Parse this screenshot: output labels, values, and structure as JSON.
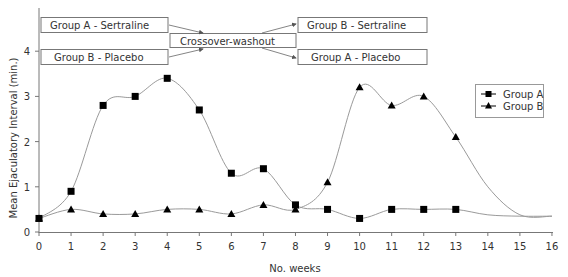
{
  "chart_data": {
    "type": "line",
    "title": "",
    "xlabel": "No. weeks",
    "ylabel": "Mean Ejaculatory Interval (min.)",
    "xlim": [
      0,
      16
    ],
    "ylim": [
      0,
      4.4
    ],
    "x_ticks": [
      0,
      1,
      2,
      3,
      4,
      5,
      6,
      7,
      8,
      9,
      10,
      11,
      12,
      13,
      14,
      15,
      16
    ],
    "y_ticks": [
      0,
      1,
      2,
      3,
      4
    ],
    "grid": false,
    "legend_position": "upper right",
    "x": [
      0,
      1,
      2,
      3,
      4,
      5,
      6,
      7,
      8,
      9,
      10,
      11,
      12,
      13
    ],
    "series": [
      {
        "name": "Group A",
        "marker": "square",
        "values": [
          0.3,
          0.9,
          2.8,
          3.0,
          3.4,
          2.7,
          1.3,
          1.4,
          0.6,
          0.5,
          0.3,
          0.5,
          0.5,
          0.5
        ],
        "tail": [
          [
            14,
            0.38
          ],
          [
            15,
            0.35
          ],
          [
            16,
            0.35
          ]
        ]
      },
      {
        "name": "Group B",
        "marker": "triangle",
        "values": [
          0.3,
          0.5,
          0.4,
          0.4,
          0.5,
          0.5,
          0.4,
          0.6,
          0.5,
          1.1,
          3.2,
          2.8,
          3.0,
          2.1
        ],
        "tail": [
          [
            14,
            1.0
          ],
          [
            15,
            0.38
          ],
          [
            16,
            0.35
          ]
        ]
      }
    ],
    "annotations": [
      {
        "label": "Group A - Sertraline",
        "position": "top-left"
      },
      {
        "label": "Group B - Placebo",
        "position": "bottom-left"
      },
      {
        "label": "Crossover-washout",
        "position": "center"
      },
      {
        "label": "Group B - Sertraline",
        "position": "top-right"
      },
      {
        "label": "Group A - Placebo",
        "position": "bottom-right"
      }
    ]
  },
  "labels": {
    "xlabel": "No. weeks",
    "ylabel": "Mean Ejaculatory Interval (min.)",
    "legend_a": "Group A",
    "legend_b": "Group B",
    "box_a_sert": "Group A - Sertraline",
    "box_b_plac": "Group B - Placebo",
    "box_washout": "Crossover-washout",
    "box_b_sert": "Group B - Sertraline",
    "box_a_plac": "Group A - Placebo"
  },
  "colors": {
    "line": "#9a9a9a",
    "marker": "#000000",
    "axis": "#777777",
    "text": "#333333"
  }
}
